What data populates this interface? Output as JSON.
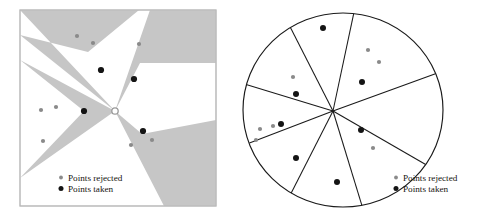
{
  "figure": {
    "background_color": "#ffffff",
    "ink_color": "#1a1a1a",
    "shaded_region_color": "#c6c6c6",
    "rejected_point_color": "#8a8a8a",
    "taken_point_color": "#141414"
  },
  "legend": {
    "rejected_label": "Points rejected",
    "taken_label": "Points taken",
    "rejected_marker": "small-gray-dot",
    "taken_marker": "small-black-dot"
  },
  "chart_data": [
    {
      "type": "scatter",
      "name": "left-panel",
      "title": "",
      "xlabel": "",
      "ylabel": "",
      "grid": false,
      "legend_position": "bottom-left",
      "panel_frame": {
        "x": 20,
        "y": 10,
        "width": 196,
        "height": 196
      },
      "center": {
        "x": 115,
        "y": 111,
        "marker": "open-circle"
      },
      "shaded_wedges": [
        {
          "id": "wedge-top-left",
          "apex": [
            115,
            111
          ],
          "points": [
            [
              20,
              10
            ],
            [
              139,
              10
            ],
            [
              88,
              52
            ],
            [
              20,
              35
            ]
          ]
        },
        {
          "id": "wedge-left",
          "apex": [
            115,
            111
          ],
          "points": [
            [
              20,
              60
            ],
            [
              84,
              111
            ],
            [
              20,
              178
            ]
          ]
        },
        {
          "id": "wedge-upper-right",
          "apex": [
            115,
            111
          ],
          "points": [
            [
              150,
              10
            ],
            [
              216,
              10
            ],
            [
              216,
              63
            ],
            [
              140,
              63
            ]
          ]
        },
        {
          "id": "wedge-lower-right",
          "apex": [
            115,
            111
          ],
          "points": [
            [
              142,
              134
            ],
            [
              216,
              120
            ],
            [
              216,
              206
            ],
            [
              164,
              206
            ]
          ]
        }
      ],
      "series": [
        {
          "name": "Points rejected",
          "color": "#8a8a8a",
          "points": [
            [
              77,
              36
            ],
            [
              93,
              43
            ],
            [
              139,
              44
            ],
            [
              41,
              110
            ],
            [
              56,
              107
            ],
            [
              43,
              141
            ],
            [
              131,
              145
            ],
            [
              152,
              140
            ]
          ]
        },
        {
          "name": "Points taken",
          "color": "#141414",
          "points": [
            [
              101,
              70
            ],
            [
              134,
              79
            ],
            [
              84,
              111
            ],
            [
              143,
              131
            ]
          ]
        }
      ]
    },
    {
      "type": "scatter",
      "name": "right-panel",
      "title": "",
      "xlabel": "",
      "ylabel": "",
      "grid": false,
      "legend_position": "bottom-right",
      "ellipse": {
        "cx": 343,
        "cy": 110,
        "rx": 100,
        "ry": 97
      },
      "sector_center": {
        "x": 333,
        "y": 111
      },
      "sector_boundary_angles_deg": [
        78,
        117,
        163,
        201,
        243,
        287,
        330,
        20
      ],
      "sector_count": 8,
      "series": [
        {
          "name": "Points rejected",
          "color": "#8a8a8a",
          "points": [
            [
              368,
              50
            ],
            [
              379,
              62
            ],
            [
              293,
              77
            ],
            [
              260,
              129
            ],
            [
              273,
              126
            ],
            [
              256,
              140
            ],
            [
              373,
              148
            ]
          ]
        },
        {
          "name": "Points taken",
          "color": "#141414",
          "points": [
            [
              323,
              28
            ],
            [
              296,
              94
            ],
            [
              362,
              82
            ],
            [
              281,
              124
            ],
            [
              361,
              130
            ],
            [
              296,
              158
            ],
            [
              337,
              182
            ]
          ]
        }
      ]
    }
  ]
}
